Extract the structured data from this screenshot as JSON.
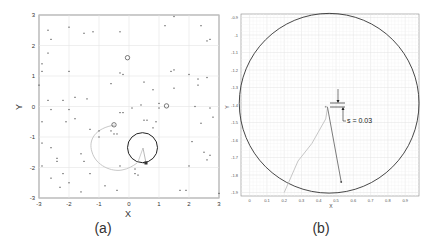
{
  "chart_data": [
    {
      "panel": "(a)",
      "type": "scatter",
      "title": "",
      "xlabel": "X",
      "ylabel": "Y",
      "xlim": [
        -3,
        3
      ],
      "ylim": [
        -3,
        3
      ],
      "xticks": [
        "-3",
        "-2",
        "-1",
        "0",
        "1",
        "2",
        "3"
      ],
      "yticks": [
        "-3",
        "-2",
        "-1",
        "0",
        "1",
        "2",
        "3"
      ],
      "grid": true,
      "caption": "(a)",
      "series": [
        {
          "name": "scattered points",
          "marker": "dot",
          "color": "#555555",
          "points": [
            [
              -2.7,
              2.5
            ],
            [
              -2.6,
              2.2
            ],
            [
              -2.0,
              2.6
            ],
            [
              -1.5,
              2.4
            ],
            [
              -1.2,
              2.45
            ],
            [
              -0.3,
              2.45
            ],
            [
              1.2,
              2.65
            ],
            [
              1.5,
              2.95
            ],
            [
              2.4,
              2.65
            ],
            [
              2.6,
              2.15
            ],
            [
              2.7,
              2.2
            ],
            [
              -2.7,
              1.75
            ],
            [
              -2.9,
              1.4
            ],
            [
              -2.9,
              1.15
            ],
            [
              -2.0,
              1.15
            ],
            [
              -0.3,
              1.1
            ],
            [
              -0.2,
              1.05
            ],
            [
              1.4,
              1.15
            ],
            [
              1.5,
              1.2
            ],
            [
              2.0,
              1.05
            ],
            [
              2.3,
              0.9
            ],
            [
              2.6,
              0.95
            ],
            [
              -3.0,
              0.7
            ],
            [
              -0.6,
              0.75
            ],
            [
              0.5,
              0.8
            ],
            [
              0.8,
              0.55
            ],
            [
              1.5,
              0.6
            ],
            [
              2.3,
              0.7
            ],
            [
              -2.7,
              0.2
            ],
            [
              -2.2,
              0.2
            ],
            [
              -1.8,
              0.3
            ],
            [
              -1.4,
              0.25
            ],
            [
              -2.6,
              -0.1
            ],
            [
              -2.0,
              -0.1
            ],
            [
              0.1,
              -0.05
            ],
            [
              0.4,
              0.05
            ],
            [
              1.0,
              0.1
            ],
            [
              1.0,
              -0.05
            ],
            [
              2.2,
              0.0
            ],
            [
              2.7,
              -0.05
            ],
            [
              2.8,
              -0.35
            ],
            [
              -2.9,
              -0.5
            ],
            [
              -2.1,
              -0.5
            ],
            [
              -1.8,
              -0.4
            ],
            [
              -0.3,
              -0.2
            ],
            [
              -0.2,
              -0.2
            ],
            [
              0.5,
              -0.45
            ],
            [
              0.6,
              -0.45
            ],
            [
              0.8,
              -0.7
            ],
            [
              0.9,
              -0.5
            ],
            [
              2.4,
              -0.55
            ],
            [
              -1.3,
              -0.75
            ],
            [
              -1.0,
              -0.8
            ],
            [
              -0.6,
              -0.8
            ],
            [
              -0.5,
              -0.9
            ],
            [
              -0.4,
              -0.9
            ],
            [
              -1.0,
              -1.0
            ],
            [
              -2.9,
              -1.2
            ],
            [
              -2.6,
              -1.35
            ],
            [
              2.1,
              -1.15
            ],
            [
              -2.4,
              -1.7
            ],
            [
              -1.6,
              -1.55
            ],
            [
              -1.5,
              -1.8
            ],
            [
              -2.4,
              -1.8
            ],
            [
              -2.9,
              -1.95
            ],
            [
              -0.3,
              -1.95
            ],
            [
              0.2,
              -2.05
            ],
            [
              0.2,
              -2.2
            ],
            [
              0.3,
              -2.25
            ],
            [
              0.5,
              -1.85
            ],
            [
              2.0,
              -1.95
            ],
            [
              2.5,
              -1.5
            ],
            [
              2.7,
              -1.6
            ],
            [
              2.6,
              -1.75
            ],
            [
              -2.6,
              -2.35
            ],
            [
              -2.2,
              -2.2
            ],
            [
              -2.0,
              -2.5
            ],
            [
              -1.3,
              -2.2
            ],
            [
              -2.3,
              -2.65
            ],
            [
              -1.6,
              -2.8
            ],
            [
              -0.8,
              -2.6
            ],
            [
              -0.4,
              -2.75
            ],
            [
              1.7,
              -2.75
            ],
            [
              1.9,
              -2.75
            ],
            [
              3.0,
              -2.85
            ]
          ]
        },
        {
          "name": "open circle markers",
          "marker": "open-circle",
          "points": [
            [
              -0.05,
              1.6
            ],
            [
              1.25,
              0.02
            ],
            [
              -0.5,
              -0.6
            ]
          ]
        },
        {
          "name": "trajectory (light)",
          "type": "line",
          "color": "#c8c8c8"
        },
        {
          "name": "sensing circle",
          "type": "circle",
          "center": [
            0.45,
            -1.35
          ],
          "radius": 0.5,
          "color": "#222222"
        }
      ]
    },
    {
      "panel": "(b)",
      "type": "line",
      "title": "",
      "xlabel": "X",
      "ylabel": "Y",
      "xlim": [
        -0.05,
        0.98
      ],
      "ylim": [
        -1.92,
        -0.88
      ],
      "xticks": [
        "0",
        "0.1",
        "0.2",
        "0.3",
        "0.4",
        "0.5",
        "0.6",
        "0.7",
        "0.8",
        "0.9"
      ],
      "yticks": [
        "-0.9",
        "-1",
        "-1.1",
        "-1.2",
        "-1.3",
        "-1.4",
        "-1.5",
        "-1.6",
        "-1.7",
        "-1.8",
        "-1.9"
      ],
      "grid": true,
      "caption": "(b)",
      "annotation": "s = 0.03",
      "series": [
        {
          "name": "circle",
          "type": "circle",
          "center": [
            0.46,
            -1.39
          ],
          "radius": 0.52,
          "color": "#333333"
        },
        {
          "name": "light trajectory",
          "color": "#c0c0c0",
          "points": [
            [
              0.2,
              -1.9
            ],
            [
              0.28,
              -1.72
            ],
            [
              0.36,
              -1.62
            ],
            [
              0.44,
              -1.48
            ],
            [
              0.45,
              -1.42
            ]
          ]
        },
        {
          "name": "dark segment",
          "color": "#444444",
          "points": [
            [
              0.45,
              -1.41
            ],
            [
              0.53,
              -1.84
            ]
          ]
        }
      ]
    }
  ]
}
